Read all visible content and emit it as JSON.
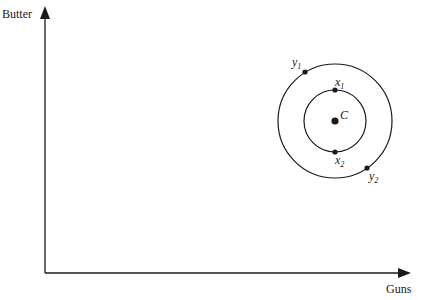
{
  "diagram": {
    "axes": {
      "y_label": "Butter",
      "x_label": "Guns"
    },
    "center": {
      "label": "C"
    },
    "inner_circle": {
      "points": [
        {
          "name": "x",
          "sub": "1",
          "position": "top"
        },
        {
          "name": "x",
          "sub": "2",
          "position": "bottom"
        }
      ]
    },
    "outer_circle": {
      "points": [
        {
          "name": "y",
          "sub": "1",
          "position": "upper-left"
        },
        {
          "name": "y",
          "sub": "2",
          "position": "lower-right"
        }
      ]
    },
    "colors": {
      "stroke": "#1a1a1a",
      "background": "#ffffff"
    }
  }
}
